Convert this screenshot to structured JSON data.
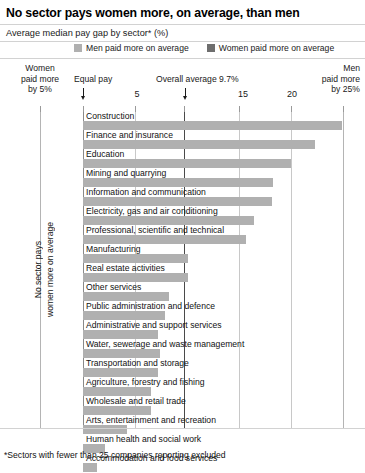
{
  "title": "No sector pays women more, on average, than men",
  "subtitle": "Average median pay gap by sector* (%)",
  "footnote": "*Sectors with fewer than 25 companies reporting excluded",
  "legend": {
    "items": [
      {
        "label": "Men paid more on average",
        "color": "#b0b0b0"
      },
      {
        "label": "Women paid more on average",
        "color": "#6e6e6e"
      }
    ]
  },
  "axis": {
    "left_note": "Women\npaid more\nby 5%",
    "left_note_l1": "Women",
    "left_note_l2": "paid more",
    "left_note_l3": "by 5%",
    "equal_pay_label": "Equal pay",
    "overall_average_label": "Overall average 9.7%",
    "right_note_l1": "Men",
    "right_note_l2": "paid more",
    "right_note_l3": "by 25%",
    "ticks": [
      {
        "value": -5,
        "label": ""
      },
      {
        "value": 0,
        "label": ""
      },
      {
        "value": 5,
        "label": "5"
      },
      {
        "value": 10,
        "label": ""
      },
      {
        "value": 15,
        "label": "15"
      },
      {
        "value": 20,
        "label": "20"
      },
      {
        "value": 25,
        "label": ""
      }
    ]
  },
  "vertical_annotation": {
    "line1": "No sector pays",
    "line2": "women more on average"
  },
  "chart_data": {
    "type": "bar",
    "orientation": "horizontal",
    "title": "No sector pays women more, on average, than men",
    "subtitle": "Average median pay gap by sector* (%)",
    "xlabel": "Average median pay gap (%)",
    "ylabel": "",
    "xlim": [
      -5,
      25
    ],
    "grid": true,
    "legend_position": "top",
    "overall_average": 9.7,
    "bar_color": "#b0b0b0",
    "categories": [
      "Construction",
      "Finance and insurance",
      "Education",
      "Mining and quarrying",
      "Information and communication",
      "Electricity, gas and air conditioning",
      "Professional, scientific and technical",
      "Manufacturing",
      "Real estate activities",
      "Other services",
      "Public administration and defence",
      "Administrative and support services",
      "Water, sewerage and waste management",
      "Transportation and storage",
      "Agriculture, forestry and fishing",
      "Wholesale and retail trade",
      "Arts, entertainment and recreation",
      "Human health and social work",
      "Accommodation and food services"
    ],
    "values": [
      24.9,
      22.3,
      20.0,
      18.3,
      18.2,
      16.4,
      15.7,
      10.1,
      10.1,
      8.3,
      7.9,
      7.2,
      7.4,
      7.2,
      6.5,
      6.5,
      4.2,
      2.1,
      1.3
    ]
  }
}
